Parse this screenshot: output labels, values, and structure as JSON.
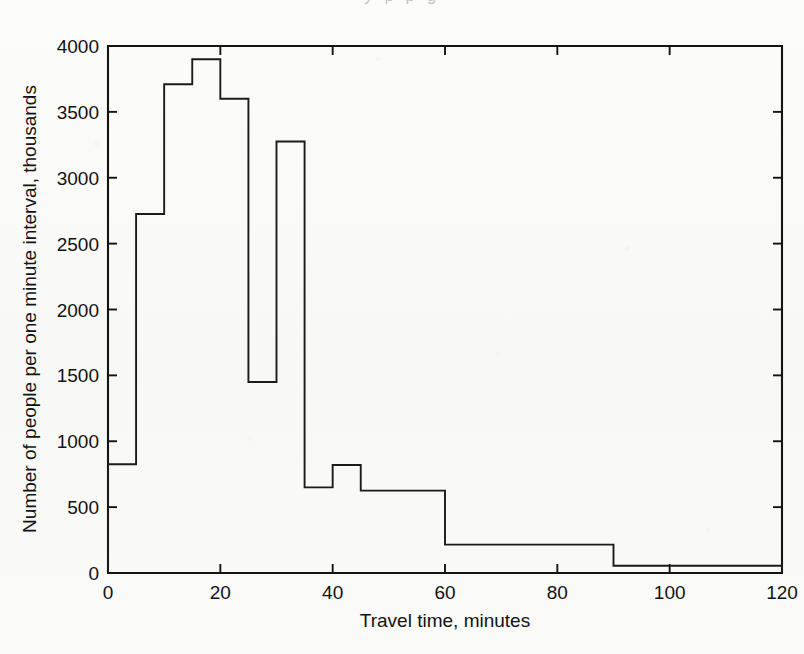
{
  "page": {
    "bleed_text_above": "y p p g"
  },
  "chart_data": {
    "type": "bar",
    "title": "",
    "subtitle": "",
    "xlabel": "Travel time, minutes",
    "ylabel": "Number of people per one minute interval, thousands",
    "xlim": [
      0,
      120
    ],
    "ylim": [
      0,
      4000
    ],
    "grid": false,
    "legend": null,
    "legend_position": "none",
    "xticks": [
      0,
      20,
      40,
      60,
      80,
      100,
      120
    ],
    "xtick_labels": [
      "0",
      "20",
      "40",
      "60",
      "80",
      "100",
      "120"
    ],
    "yticks": [
      0,
      500,
      1000,
      1500,
      2000,
      2500,
      3000,
      3500,
      4000
    ],
    "ytick_labels": [
      "0",
      "500",
      "1000",
      "1500",
      "2000",
      "2500",
      "3000",
      "3500",
      "4000"
    ],
    "bin_edges": [
      0,
      5,
      10,
      15,
      20,
      25,
      30,
      35,
      40,
      45,
      60,
      90,
      120
    ],
    "categories": [
      "0-5",
      "5-10",
      "10-15",
      "15-20",
      "20-25",
      "25-30",
      "30-35",
      "35-40",
      "40-45",
      "45-60",
      "60-90",
      "90-120"
    ],
    "values": [
      825,
      2725,
      3710,
      3900,
      3600,
      1450,
      3275,
      650,
      820,
      625,
      215,
      55
    ],
    "series": [
      {
        "name": "People per one minute interval",
        "values": [
          825,
          2725,
          3710,
          3900,
          3600,
          1450,
          3275,
          650,
          820,
          625,
          215,
          55
        ]
      }
    ],
    "annotations": []
  },
  "style": {
    "line_color": "#1b1b1b",
    "axis_color": "#141414",
    "background": "#fbfbf9"
  }
}
